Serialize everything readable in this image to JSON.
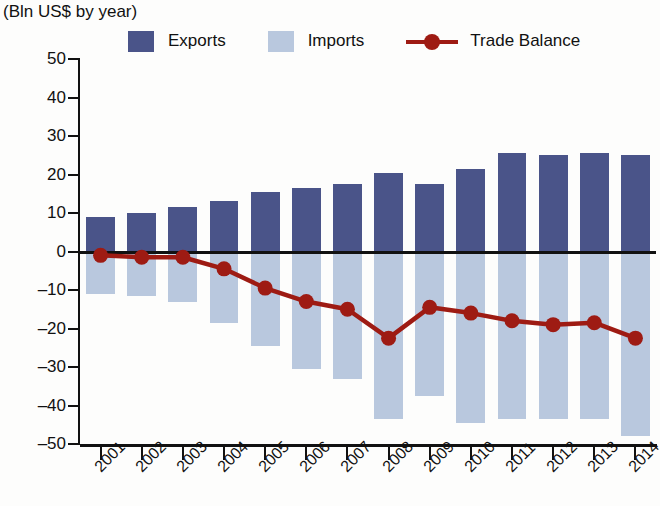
{
  "header": {
    "title": "",
    "subtitle": "(Bln US$ by year)"
  },
  "legend": [
    {
      "label": "Exports",
      "type": "square",
      "color": "#4a5489"
    },
    {
      "label": "Imports",
      "type": "square",
      "color": "#b9c8de"
    },
    {
      "label": "Trade Balance",
      "type": "line-marker",
      "color": "#9e1b13"
    }
  ],
  "axis": {
    "y_ticks": [
      "50",
      "40",
      "30",
      "20",
      "10",
      "0",
      "-10",
      "-20",
      "-30",
      "-40",
      "-50"
    ],
    "x_ticks": [
      "2001",
      "2002",
      "2003",
      "2004",
      "2005",
      "2006",
      "2007",
      "2008",
      "2009",
      "2010",
      "2011",
      "2012",
      "2013",
      "2014"
    ]
  },
  "colors": {
    "exports": "#4a5489",
    "imports": "#b9c8de",
    "balance": "#9e1b13",
    "axis": "#111111",
    "background": "#fdfdfc"
  },
  "chart_data": {
    "type": "bar",
    "title": "",
    "subtitle": "(Bln US$ by year)",
    "xlabel": "",
    "ylabel": "Bln US$",
    "ylim": [
      -50,
      50
    ],
    "ytick_step": 10,
    "grid": false,
    "legend_position": "top",
    "categories": [
      "2001",
      "2002",
      "2003",
      "2004",
      "2005",
      "2006",
      "2007",
      "2008",
      "2009",
      "2010",
      "2011",
      "2012",
      "2013",
      "2014"
    ],
    "series": [
      {
        "name": "Exports",
        "type": "bar",
        "color": "#4a5489",
        "values": [
          9,
          10,
          11.5,
          13,
          15.5,
          16.5,
          17.5,
          20.5,
          17.5,
          21.5,
          25.5,
          25,
          25.5,
          25
        ]
      },
      {
        "name": "Imports",
        "type": "bar",
        "color": "#b9c8de",
        "values": [
          -11,
          -11.5,
          -13,
          -18.5,
          -24.5,
          -30.5,
          -33,
          -43.5,
          -37.5,
          -44.5,
          -43.5,
          -43.5,
          -43.5,
          -48
        ]
      },
      {
        "name": "Trade Balance",
        "type": "line",
        "color": "#9e1b13",
        "values": [
          -1,
          -1.5,
          -1.5,
          -4.5,
          -9.5,
          -13,
          -15,
          -22.5,
          -14.5,
          -16,
          -18,
          -19,
          -18.5,
          -22.5
        ]
      }
    ]
  }
}
